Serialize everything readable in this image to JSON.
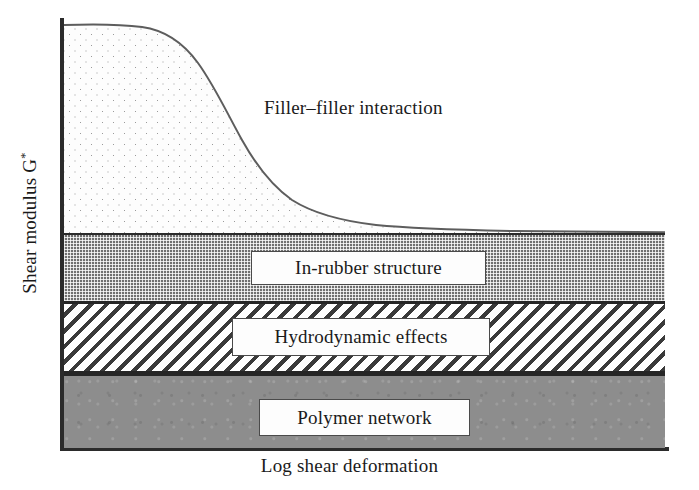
{
  "figure": {
    "kind": "payne-effect-schematic",
    "background_color": "#ffffff"
  },
  "axes": {
    "y_label_text": "Shear modulus G",
    "y_label_superscript": "*",
    "x_label_text": "Log shear deformation",
    "axis_color": "#2b2b2b"
  },
  "annotations": {
    "filler_filler": "Filler–filler interaction"
  },
  "bands": [
    {
      "id": "filler-filler",
      "label": "Filler–filler interaction",
      "fill": "dotted",
      "fill_color": "#fdfdfd",
      "pattern_color": "#9a9a9a",
      "callout_boxed": false
    },
    {
      "id": "in-rubber",
      "label": "In-rubber structure",
      "fill": "checkerboard",
      "fill_color": "#6f6f6f",
      "pattern_color": "#ffffff",
      "callout_boxed": true
    },
    {
      "id": "hydrodynamic",
      "label": "Hydrodynamic effects",
      "fill": "diagonal-hatch",
      "fill_color": "#ffffff",
      "pattern_color": "#3a3a3a",
      "callout_boxed": true
    },
    {
      "id": "polymer-network",
      "label": "Polymer network",
      "fill": "solid-gray",
      "fill_color": "#8d8d8d",
      "pattern_color": "#8d8d8d",
      "callout_boxed": true
    }
  ],
  "chart_data": {
    "type": "area",
    "title": "",
    "subtitle": "",
    "xlabel": "Log shear deformation",
    "ylabel": "Shear modulus G*",
    "xlim": [
      0,
      1
    ],
    "ylim": [
      0,
      1
    ],
    "grid": false,
    "legend_position": "none",
    "axis_ticks": {
      "x": [],
      "y": []
    },
    "note": "Schematic decomposition of the shear modulus of filled rubber (Payne effect). Axes are unlabelled/qualitative; values below are normalized 0-1 with y=0 at the x-axis and y=1 at the top of the plotting box.",
    "stacked_series": [
      {
        "name": "Polymer network",
        "fill": "solid-gray",
        "constant": true,
        "y_bottom": 0.0,
        "y_top": 0.175
      },
      {
        "name": "Hydrodynamic effects",
        "fill": "diagonal-hatch",
        "constant": true,
        "y_bottom": 0.175,
        "y_top": 0.342
      },
      {
        "name": "In-rubber structure",
        "fill": "checkerboard",
        "constant": true,
        "y_bottom": 0.342,
        "y_top": 0.5
      },
      {
        "name": "Filler–filler interaction",
        "fill": "dotted",
        "constant": false,
        "y_bottom": 0.5,
        "curve_x": [
          0.0,
          0.06,
          0.12,
          0.17,
          0.22,
          0.27,
          0.31,
          0.36,
          0.41,
          0.46,
          0.52,
          0.58,
          0.64,
          0.71,
          0.78,
          0.86,
          0.93,
          1.0
        ],
        "curve_y": [
          1.0,
          0.998,
          0.992,
          0.975,
          0.938,
          0.878,
          0.8,
          0.712,
          0.636,
          0.58,
          0.548,
          0.53,
          0.519,
          0.512,
          0.508,
          0.505,
          0.503,
          0.5
        ]
      }
    ]
  }
}
